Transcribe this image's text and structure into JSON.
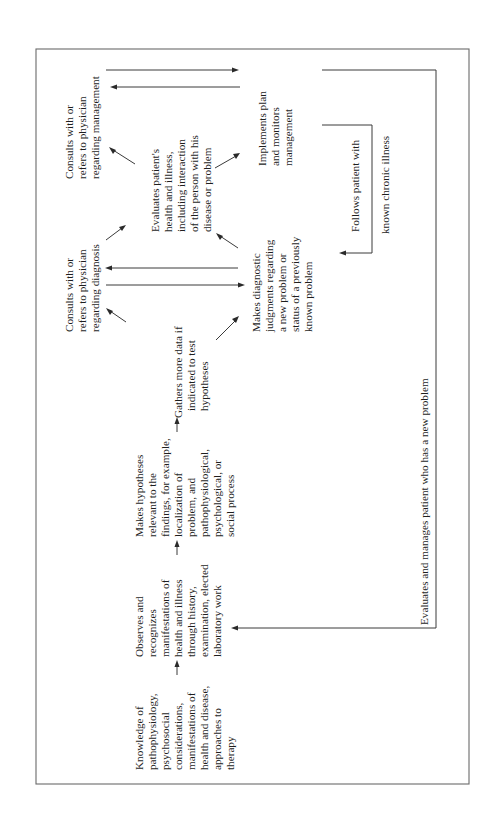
{
  "diagram": {
    "orientation": "rotated-90-ccw",
    "colors": {
      "text": "#1e1e1e",
      "lines": "#3a3a3a",
      "frame": "#6a6a6a",
      "background": "#ffffff"
    },
    "nodes": {
      "knowledge": {
        "lines": [
          "Knowledge of",
          "pathophysiology,",
          "psychosocial",
          "considerations,",
          "manifestations of",
          "health and disease,",
          "approaches to",
          "therapy"
        ]
      },
      "observes": {
        "lines": [
          "Observes and",
          "recognizes",
          "manifestations of",
          "health and illness",
          "through history,",
          "examination, elected",
          "laboratory work"
        ]
      },
      "hypotheses": {
        "lines": [
          "Makes hypotheses",
          "relevant to the",
          "findings, for example,",
          "localization of",
          "problem, and",
          "pathophysiological,",
          "psychological, or",
          "social process"
        ]
      },
      "gathers": {
        "lines": [
          "Gathers more data if",
          "indicated to test",
          "hypotheses"
        ]
      },
      "consults_diagnosis": {
        "lines": [
          "Consults with or",
          "refers to physician",
          "regarding diagnosis"
        ]
      },
      "diagnostic_judgments": {
        "lines": [
          "Makes diagnostic",
          "judgments regarding",
          "a new problem or",
          "status of a previously",
          "known problem"
        ]
      },
      "evaluates_health": {
        "lines": [
          "Evaluates patient's",
          "health and illness,",
          "including interaction",
          "of the person with his",
          "disease or problem"
        ]
      },
      "consults_management": {
        "lines": [
          "Consults with or",
          "refers to physician",
          "regarding management"
        ]
      },
      "implements": {
        "lines": [
          "Implements plan",
          "and monitors",
          "management"
        ]
      },
      "chronic_loop": {
        "line1": "Follows patient with",
        "line2": "known chronic illness"
      },
      "new_problem_loop": {
        "label": "Evaluates and manages patient who has a new problem"
      }
    }
  }
}
